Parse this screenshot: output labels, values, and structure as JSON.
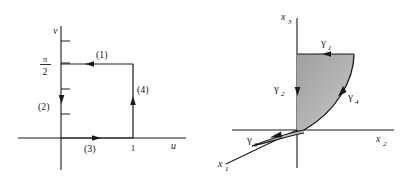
{
  "figure": {
    "background_color": "#ffffff",
    "stroke_color": "#1a1a1a",
    "region_fill_color": "#a8a8a8",
    "panels": [
      {
        "id": "uv-plane",
        "name": "parameter-domain-uv",
        "axes": {
          "horizontal_label": "u",
          "vertical_label": "v"
        },
        "tick_labels": [
          {
            "name": "pi-over-two",
            "numerator": "π",
            "denominator": "2",
            "axis": "v"
          },
          {
            "name": "one",
            "text": "1",
            "axis": "u"
          }
        ],
        "curve_labels": [
          {
            "name": "segment-1",
            "text": "(1)",
            "direction": "left"
          },
          {
            "name": "segment-2",
            "text": "(2)",
            "direction": "down"
          },
          {
            "name": "segment-3",
            "text": "(3)",
            "direction": "right"
          },
          {
            "name": "segment-4",
            "text": "(4)",
            "direction": "up"
          }
        ]
      },
      {
        "id": "x-space",
        "name": "surface-in-x-space",
        "axes": {
          "x1_label": "x",
          "x1_sub": "1",
          "x2_label": "x",
          "x2_sub": "2",
          "x3_label": "x",
          "x3_sub": "3"
        },
        "curve_labels": [
          {
            "name": "gamma-1",
            "glyph": "γ",
            "sub": "1",
            "direction": "left"
          },
          {
            "name": "gamma-2",
            "glyph": "γ",
            "sub": "2",
            "direction": "down"
          },
          {
            "name": "gamma-3",
            "glyph": "γ",
            "sub": "3",
            "direction": "left"
          },
          {
            "name": "gamma-4",
            "glyph": "γ",
            "sub": "4",
            "direction": "up"
          }
        ]
      }
    ]
  }
}
